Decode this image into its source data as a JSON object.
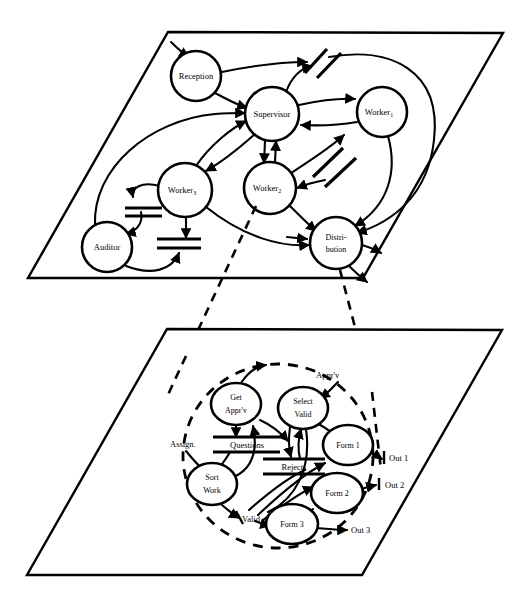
{
  "figure": {
    "background_color": "#ffffff",
    "stroke_color": "#000000"
  },
  "upper_plane": {
    "name": "organisation-plane",
    "shape": "parallelogram",
    "corners": [
      [
        168,
        32
      ],
      [
        503,
        33
      ],
      [
        363,
        278
      ],
      [
        28,
        278
      ]
    ],
    "nodes": [
      {
        "id": "reception",
        "label": "Reception",
        "shape": "circle",
        "cx": 196,
        "cy": 76,
        "r": 25
      },
      {
        "id": "supervisor",
        "label": "Supervisor",
        "shape": "circle",
        "cx": 272,
        "cy": 114,
        "r": 27
      },
      {
        "id": "worker1",
        "label": "Worker",
        "sub": "1",
        "shape": "circle",
        "cx": 382,
        "cy": 112,
        "r": 25
      },
      {
        "id": "worker2",
        "label": "Worker",
        "sub": "2",
        "shape": "circle",
        "cx": 270,
        "cy": 188,
        "r": 26
      },
      {
        "id": "worker3",
        "label": "Worker",
        "sub": "3",
        "shape": "circle",
        "cx": 185,
        "cy": 190,
        "r": 27
      },
      {
        "id": "auditor",
        "label": "Auditor",
        "shape": "circle",
        "cx": 107,
        "cy": 247,
        "r": 25
      },
      {
        "id": "distribution",
        "label_line1": "Distri-",
        "label_line2": "bution",
        "shape": "circle",
        "cx": 336,
        "cy": 243,
        "r": 26
      }
    ],
    "stores": [
      {
        "id": "store-top-right-a",
        "style": "diagonal-double-bar"
      },
      {
        "id": "store-top-right-b",
        "style": "diagonal-double-bar"
      },
      {
        "id": "store-mid-right-a",
        "style": "diagonal-double-bar"
      },
      {
        "id": "store-mid-right-b",
        "style": "diagonal-double-bar"
      },
      {
        "id": "store-auditor-upper",
        "style": "horizontal-double-bar"
      },
      {
        "id": "store-auditor-lower",
        "style": "horizontal-double-bar"
      }
    ]
  },
  "lower_plane": {
    "name": "process-plane",
    "shape": "parallelogram",
    "corners": [
      [
        167,
        329
      ],
      [
        502,
        330
      ],
      [
        362,
        575
      ],
      [
        27,
        575
      ]
    ],
    "bubble": {
      "id": "process-bubble",
      "style": "dashed-ellipse",
      "cx": 278,
      "cy": 456,
      "rx": 95,
      "ry": 92
    },
    "nodes": [
      {
        "id": "get-apprv",
        "label_line1": "Get",
        "label_line2": "Appr'v",
        "shape": "ellipse",
        "cx": 236,
        "cy": 404,
        "rx": 25,
        "ry": 21
      },
      {
        "id": "select-valid",
        "label_line1": "Select",
        "label_line2": "Valid",
        "shape": "ellipse",
        "cx": 303,
        "cy": 408,
        "rx": 25,
        "ry": 21
      },
      {
        "id": "form-1",
        "label": "Form 1",
        "shape": "ellipse",
        "cx": 348,
        "cy": 445,
        "rx": 25,
        "ry": 20
      },
      {
        "id": "form-2",
        "label": "Form 2",
        "shape": "ellipse",
        "cx": 337,
        "cy": 493,
        "rx": 26,
        "ry": 20
      },
      {
        "id": "form-3",
        "label": "Form 3",
        "shape": "ellipse",
        "cx": 292,
        "cy": 524,
        "rx": 26,
        "ry": 20
      },
      {
        "id": "sort-work",
        "label_line1": "Sort",
        "label_line2": "Work",
        "shape": "ellipse",
        "cx": 212,
        "cy": 484,
        "rx": 25,
        "ry": 21
      }
    ],
    "stores": [
      {
        "id": "questions-store",
        "label": "Questions",
        "style": "horizontal-double-bar",
        "x": 246,
        "y": 442
      },
      {
        "id": "rejects-store",
        "label": "Rejects",
        "style": "horizontal-double-bar",
        "x": 293,
        "y": 465
      }
    ],
    "edge_labels": [
      {
        "id": "apprv-label",
        "text": "Appr'v",
        "x": 316,
        "y": 375
      },
      {
        "id": "assign-label",
        "text": "Assign.",
        "x": 188,
        "y": 444
      },
      {
        "id": "valid-label",
        "text": "Valid",
        "x": 241,
        "y": 517
      },
      {
        "id": "out1-label",
        "text": "Out 1",
        "x": 396,
        "y": 458
      },
      {
        "id": "out2-label",
        "text": "Out 2",
        "x": 392,
        "y": 483
      },
      {
        "id": "out3-label",
        "text": "Out 3",
        "x": 368,
        "y": 528
      }
    ]
  },
  "projection_lines": {
    "name": "plane-projection",
    "style": "dashed",
    "count": 2,
    "from_nodes": [
      "worker2",
      "distribution"
    ],
    "to": "process-bubble"
  }
}
